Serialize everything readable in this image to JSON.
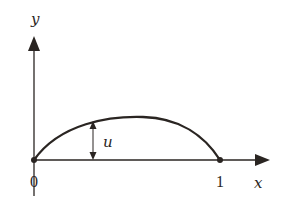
{
  "diagram": {
    "axes": {
      "x_label": "x",
      "y_label": "y"
    },
    "ticks": {
      "origin_label": "0",
      "end_label": "1"
    },
    "curve": {
      "type": "arch",
      "start": [
        0,
        0
      ],
      "end": [
        1,
        0
      ],
      "peak_x": 0.57
    },
    "annotation": {
      "label": "u",
      "meaning": "vertical displacement of the curve from the x-axis"
    },
    "colors": {
      "stroke": "#2a2522",
      "background": "#ffffff"
    }
  }
}
